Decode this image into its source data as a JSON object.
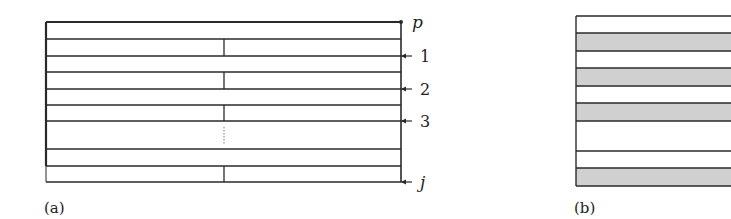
{
  "figure": {
    "panel_a": {
      "label": "(a)",
      "row_labels": [
        "p",
        "1",
        "2",
        "3",
        "j"
      ],
      "box": {
        "x": 46,
        "y": 22,
        "width": 355,
        "thick_bottom": 166,
        "full_bottom": 182
      },
      "horizontal_lines_y": [
        22,
        39,
        56,
        72,
        89,
        105,
        121,
        149,
        166,
        182
      ],
      "divider_x": 224,
      "divider_segments": [
        [
          39,
          56
        ],
        [
          72,
          89
        ],
        [
          105,
          121
        ],
        [
          166,
          182
        ]
      ],
      "dotted_segment": [
        127,
        145
      ],
      "arrows_y": [
        56,
        89,
        121,
        182
      ],
      "dot_y": 22
    },
    "panel_b": {
      "label": "(b)",
      "box": {
        "x": 576,
        "y": 16,
        "right": 731,
        "bottom": 186
      },
      "rows": [
        {
          "top": 16,
          "bottom": 33,
          "fill": "white"
        },
        {
          "top": 33,
          "bottom": 51,
          "fill": "gray"
        },
        {
          "top": 51,
          "bottom": 68,
          "fill": "white"
        },
        {
          "top": 68,
          "bottom": 86,
          "fill": "gray"
        },
        {
          "top": 86,
          "bottom": 103,
          "fill": "white"
        },
        {
          "top": 103,
          "bottom": 121,
          "fill": "gray"
        },
        {
          "top": 121,
          "bottom": 151,
          "fill": "white"
        },
        {
          "top": 151,
          "bottom": 168,
          "fill": "white"
        },
        {
          "top": 168,
          "bottom": 186,
          "fill": "gray"
        }
      ]
    },
    "colors": {
      "line": "#2a2a2a",
      "gray_fill": "#d0d0d0",
      "text": "#222222"
    }
  }
}
